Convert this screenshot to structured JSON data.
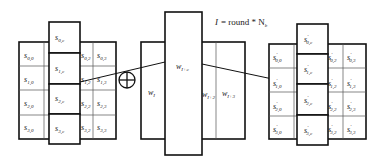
{
  "formula": {
    "lhs": "I",
    "rhs": "= round * N",
    "sub": "b"
  },
  "operator": "xor-plus",
  "state_left": {
    "rows": [
      [
        "0,0",
        "0,c",
        "0,2",
        "0,3"
      ],
      [
        "1,0",
        "1,c",
        "1,2",
        "1,3"
      ],
      [
        "2,0",
        "2,c",
        "2,2",
        "2,3"
      ],
      [
        "3,0",
        "3,c",
        "3,2",
        "3,3"
      ]
    ],
    "symbol": "s",
    "prime": ""
  },
  "key_schedule": {
    "words": [
      {
        "base": "w",
        "sub": "I"
      },
      {
        "base": "w",
        "sub": "I+c"
      },
      {
        "base": "w",
        "sub": "I+2"
      },
      {
        "base": "w",
        "sub": "I+3"
      }
    ]
  },
  "state_right": {
    "rows": [
      [
        "0,0",
        "0,c",
        "0,2",
        "0,3"
      ],
      [
        "1,0",
        "1,c",
        "1,2",
        "1,3"
      ],
      [
        "2,0",
        "2,c",
        "2,2",
        "2,3"
      ],
      [
        "3,0",
        "3,c",
        "3,2",
        "3,3"
      ]
    ],
    "symbol": "s",
    "prime": "′"
  }
}
